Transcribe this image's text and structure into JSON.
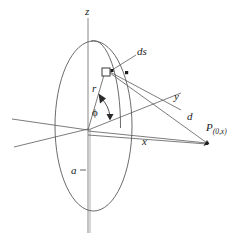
{
  "figure": {
    "background_color": "#ffffff",
    "stroke_color": "#4a4a4a",
    "text_color": "#1a1a1a",
    "width": 242,
    "height": 242
  },
  "labels": {
    "z_axis": "z",
    "y_axis": "y",
    "x_axis": "x",
    "radius": "r",
    "angle": "ϕ",
    "element": "ds",
    "distance": "d",
    "loop_radius": "a",
    "point": "P",
    "point_subscript": "(0,x)"
  },
  "geometry": {
    "origin": [
      88,
      129
    ],
    "loop_ellipse": {
      "cx": 93.5,
      "cy": 126,
      "rx": 38.5,
      "ry": 85
    },
    "inner_arc": {
      "cx": 93.5,
      "cy": 126,
      "rx": 27,
      "ry": 85
    },
    "ds_square": {
      "x": 102,
      "y": 68,
      "size": 8
    },
    "point_P": [
      207,
      143
    ],
    "y_axis_end": [
      181,
      93
    ],
    "z_axis_top": [
      88,
      18
    ],
    "z_axis_bottom": [
      88,
      233
    ]
  }
}
